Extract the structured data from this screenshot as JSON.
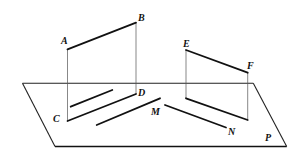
{
  "figure": {
    "labels": {
      "A": "A",
      "B": "B",
      "C": "C",
      "D": "D",
      "E": "E",
      "F": "F",
      "M": "M",
      "N": "N",
      "P": "P"
    },
    "colors": {
      "stroke": "#111111",
      "background": "#ffffff"
    }
  }
}
